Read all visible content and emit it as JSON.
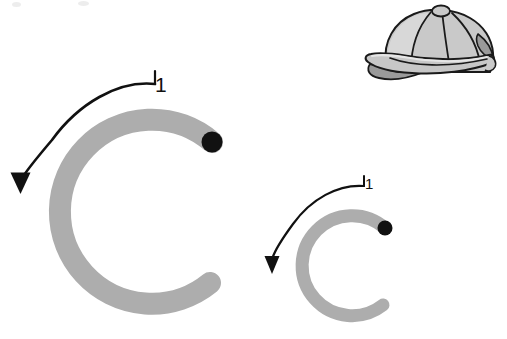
{
  "page": {
    "kind": "handwriting-practice-worksheet",
    "letter": "C",
    "background_color": "#ffffff",
    "width": 507,
    "height": 339
  },
  "colors": {
    "letter_gray": "#adadad",
    "stroke_black": "#111111",
    "cap_fill": "#c9c9c9",
    "cap_shadow": "#9a9a9a",
    "cap_outline": "#1a1a1a",
    "cap_highlight": "#d8d8d8"
  },
  "letters": [
    {
      "id": "uppercase-c",
      "glyph": "C",
      "case": "uppercase",
      "size": "large",
      "center": {
        "x": 125,
        "y": 212
      },
      "outer_radius": 95,
      "stroke_width": 22,
      "fill": "#adadad",
      "start_dot": {
        "x": 212,
        "y": 142,
        "r": 10,
        "color": "#111111"
      },
      "stroke_number": "1",
      "arrow": {
        "label": "1",
        "label_x": 155,
        "label_y": 74,
        "direction": "counterclockwise",
        "tip": {
          "x": 20,
          "y": 192
        }
      }
    },
    {
      "id": "lowercase-c",
      "glyph": "c",
      "case": "lowercase",
      "size": "small",
      "center": {
        "x": 348,
        "y": 258
      },
      "outer_radius": 53,
      "stroke_width": 13,
      "fill": "#adadad",
      "start_dot": {
        "x": 385,
        "y": 228,
        "r": 7,
        "color": "#111111"
      },
      "stroke_number": "1",
      "arrow": {
        "label": "1",
        "label_x": 365,
        "label_y": 176,
        "direction": "counterclockwise",
        "tip": {
          "x": 272,
          "y": 274
        }
      }
    }
  ],
  "illustration": {
    "id": "baseball-cap",
    "name": "baseball cap",
    "mnemonic_for": "C",
    "bounds": {
      "x": 364,
      "y": 7,
      "width": 137,
      "height": 76
    },
    "parts": [
      "crown",
      "panel-seams",
      "top-button",
      "brim",
      "brim-underside",
      "rear-mesh-panel",
      "sweatband-stripe"
    ]
  },
  "artifacts": {
    "scan_specks": [
      {
        "x": 12,
        "y": 2,
        "w": 9,
        "h": 5
      },
      {
        "x": 78,
        "y": 1,
        "w": 11,
        "h": 5
      }
    ]
  }
}
